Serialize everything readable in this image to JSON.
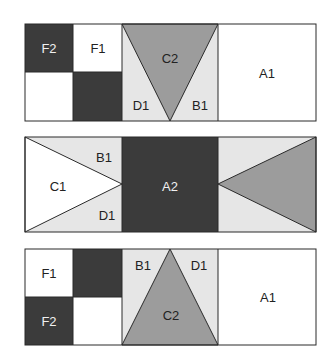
{
  "colors": {
    "white": "#ffffff",
    "light": "#e6e6e6",
    "medium": "#9c9c9c",
    "dark": "#3b3b3b",
    "line": "#2a2a2a"
  },
  "blocks": [
    {
      "name": "block-top",
      "labels": {
        "f2": "F2",
        "f1": "F1",
        "c2": "C2",
        "d1": "D1",
        "b1": "B1",
        "a1": "A1"
      }
    },
    {
      "name": "block-middle",
      "labels": {
        "b1": "B1",
        "c1": "C1",
        "d1": "D1",
        "a2": "A2"
      }
    },
    {
      "name": "block-bottom",
      "labels": {
        "f1": "F1",
        "f2": "F2",
        "b1": "B1",
        "d1": "D1",
        "c2": "C2",
        "a1": "A1"
      }
    }
  ]
}
